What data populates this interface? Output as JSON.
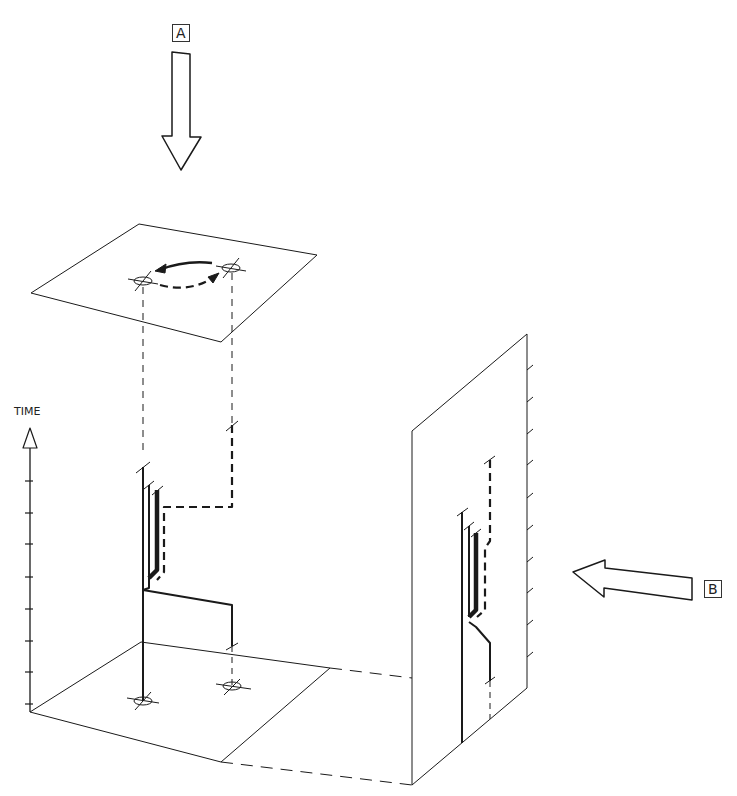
{
  "labels": {
    "view_a": "A",
    "view_b": "B",
    "time_axis": "TIME"
  },
  "colors": {
    "line": "#1a1a1a",
    "background": "#ffffff"
  },
  "diagram": {
    "time_axis_ticks": 8,
    "side_wall_ticks": 11,
    "locations": 2
  }
}
